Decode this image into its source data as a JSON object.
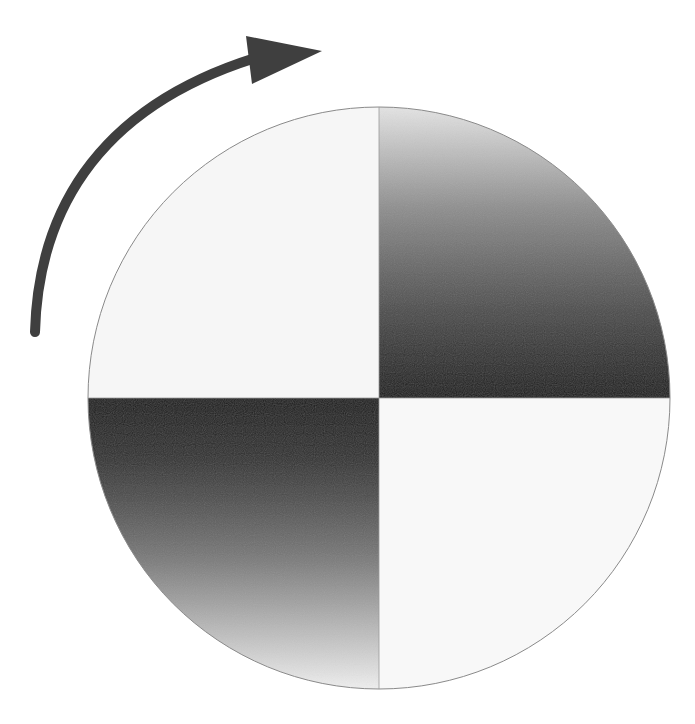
{
  "diagram": {
    "type": "rotating quadrant disk",
    "rotation_direction": "clockwise",
    "disk": {
      "center": [
        379,
        398
      ],
      "radius": 291,
      "outline_color": "#8a8a8a",
      "quadrants": [
        {
          "position": "top-left",
          "fill": "light",
          "color": "#f6f6f6"
        },
        {
          "position": "top-right",
          "fill": "gradient",
          "from_color": "#e2e2e2",
          "to_color": "#1c1c1c",
          "direction": "top-to-bottom"
        },
        {
          "position": "bottom-left",
          "fill": "gradient",
          "from_color": "#1c1c1c",
          "to_color": "#ececec",
          "direction": "top-to-bottom"
        },
        {
          "position": "bottom-right",
          "fill": "light",
          "color": "#f8f8f8"
        }
      ]
    },
    "arrow": {
      "icon": "clockwise-arrow-icon",
      "color": "#3f3f3f",
      "stroke_width": 10,
      "start": [
        35,
        334
      ],
      "head_tip": [
        322,
        51
      ]
    }
  }
}
